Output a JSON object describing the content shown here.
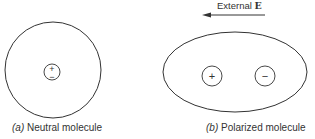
{
  "figure": {
    "panel_a": {
      "tag": "(a)",
      "caption": "Neutral molecule",
      "charges": [
        "+",
        "−"
      ]
    },
    "panel_b": {
      "tag": "(b)",
      "caption": "Polarized molecule",
      "field_label": "External",
      "field_symbol": "E",
      "field_direction": "left",
      "charges": [
        "+",
        "−"
      ]
    }
  },
  "colors": {
    "stroke": "#333333",
    "background": "#ffffff"
  }
}
